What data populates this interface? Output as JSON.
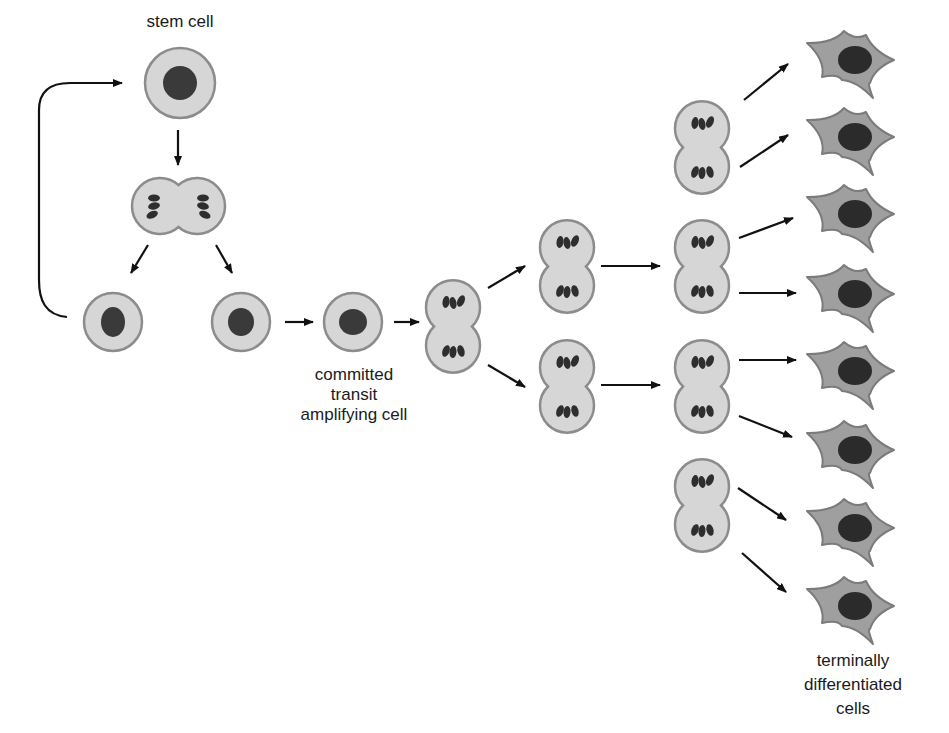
{
  "labels": {
    "stem_cell": "stem cell",
    "transit": [
      "committed",
      "transit",
      "amplifying cell"
    ],
    "terminal": [
      "terminally",
      "differentiated",
      "cells"
    ]
  },
  "colors": {
    "cytoplasm": "#d6d6d6",
    "membrane": "#8c8c8c",
    "nucleus": "#3a3a3a",
    "differentiated_cytoplasm": "#9f9f9f",
    "arrow": "#111111"
  },
  "diagram": {
    "stem_cell": {
      "cx": 180,
      "cy": 83,
      "r": 35,
      "nr": 17
    },
    "dividing_stem_cell": {
      "left": {
        "cx": 154,
        "cy": 206
      },
      "right": {
        "cx": 203,
        "cy": 206
      },
      "r": 28
    },
    "daughter_cells": [
      {
        "name": "self-renewed-stem-cell",
        "cx": 113,
        "cy": 322,
        "r": 29,
        "nrx": 12,
        "nry": 15
      },
      {
        "name": "daughter-cell",
        "cx": 241,
        "cy": 322,
        "r": 29,
        "nrx": 13,
        "nry": 14
      },
      {
        "name": "committed-transit-amplifying-cell",
        "cx": 353,
        "cy": 322,
        "r": 29,
        "nrx": 14,
        "nry": 13
      }
    ],
    "dividing_columns": [
      {
        "cx": 453,
        "cells": [
          273
        ]
      },
      {
        "cx": 567,
        "cells": [
          213,
          333
        ]
      },
      {
        "cx": 702,
        "cells": [
          94,
          213,
          333,
          452
        ]
      }
    ],
    "differentiated_cell_count": 8,
    "differentiated_cells_y": [
      60,
      137,
      214,
      294,
      371,
      450,
      528,
      606
    ],
    "arrows": [
      [
        178,
        130,
        178,
        165
      ],
      [
        148,
        245,
        131,
        273
      ],
      [
        216,
        245,
        232,
        273
      ],
      [
        285,
        322,
        313,
        322
      ],
      [
        394,
        322,
        419,
        322
      ],
      [
        488,
        288,
        525,
        266
      ],
      [
        488,
        365,
        525,
        387
      ],
      [
        601,
        266,
        660,
        266
      ],
      [
        601,
        385,
        660,
        385
      ],
      [
        744,
        100,
        788,
        64
      ],
      [
        740,
        167,
        788,
        135
      ],
      [
        739,
        238,
        793,
        218
      ],
      [
        739,
        293,
        796,
        293
      ],
      [
        739,
        360,
        796,
        360
      ],
      [
        739,
        416,
        792,
        437
      ],
      [
        738,
        488,
        786,
        520
      ],
      [
        742,
        553,
        786,
        592
      ]
    ]
  }
}
